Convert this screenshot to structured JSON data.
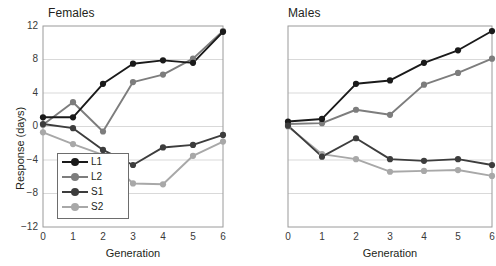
{
  "figure": {
    "ylabel": "Response (days)",
    "xlabel": "Generation"
  },
  "panels": {
    "females": {
      "title": "Females",
      "xlabel": "Generation",
      "ylabel": "Response (days)",
      "xticks": [
        "0",
        "1",
        "2",
        "3",
        "4",
        "5",
        "6"
      ],
      "yticks": [
        "12",
        "8",
        "4",
        "0",
        "−4",
        "−8",
        "−12"
      ]
    },
    "males": {
      "title": "Males",
      "xlabel": "Generation",
      "xticks": [
        "0",
        "1",
        "2",
        "3",
        "4",
        "5",
        "6"
      ]
    }
  },
  "legend": {
    "items": [
      {
        "label": "L1",
        "color": "#1a1a1a"
      },
      {
        "label": "L2",
        "color": "#7d7d7d"
      },
      {
        "label": "S1",
        "color": "#3d3d3d"
      },
      {
        "label": "S2",
        "color": "#a8a8a8"
      }
    ]
  },
  "colors": {
    "L1": "#1a1a1a",
    "L2": "#7d7d7d",
    "S1": "#3d3d3d",
    "S2": "#a8a8a8",
    "grid": "#d9d9d9",
    "axis": "#9a9a9a",
    "text": "#231f20"
  },
  "chart_data": [
    {
      "type": "line",
      "title": "Females",
      "xlabel": "Generation",
      "ylabel": "Response (days)",
      "x": [
        0,
        1,
        2,
        3,
        4,
        5,
        6
      ],
      "xlim": [
        0,
        6
      ],
      "ylim": [
        -12,
        12
      ],
      "yticks": [
        12,
        8,
        4,
        0,
        -4,
        -8,
        -12
      ],
      "grid": true,
      "legend_position": "lower-left",
      "series": [
        {
          "name": "L1",
          "color": "#1a1a1a",
          "values": [
            1.1,
            1.1,
            5.1,
            7.5,
            7.9,
            7.6,
            11.3
          ]
        },
        {
          "name": "L2",
          "color": "#7d7d7d",
          "values": [
            0.2,
            2.9,
            -0.6,
            5.3,
            6.2,
            8.1,
            11.4
          ]
        },
        {
          "name": "S1",
          "color": "#3d3d3d",
          "values": [
            0.3,
            -0.2,
            -2.8,
            -4.6,
            -2.5,
            -2.2,
            -1.0
          ]
        },
        {
          "name": "S2",
          "color": "#a8a8a8",
          "values": [
            -0.7,
            -2.1,
            -3.4,
            -6.8,
            -6.9,
            -3.5,
            -1.8
          ]
        }
      ]
    },
    {
      "type": "line",
      "title": "Males",
      "xlabel": "Generation",
      "ylabel": "Response (days)",
      "x": [
        0,
        1,
        2,
        3,
        4,
        5,
        6
      ],
      "xlim": [
        0,
        6
      ],
      "ylim": [
        -12,
        12
      ],
      "yticks": [
        12,
        8,
        4,
        0,
        -4,
        -8,
        -12
      ],
      "grid": true,
      "legend_position": "none",
      "series": [
        {
          "name": "L1",
          "color": "#1a1a1a",
          "values": [
            0.6,
            0.9,
            5.1,
            5.5,
            7.6,
            9.1,
            11.4
          ]
        },
        {
          "name": "L2",
          "color": "#7d7d7d",
          "values": [
            0.3,
            0.4,
            2.0,
            1.4,
            5.0,
            6.4,
            8.1
          ]
        },
        {
          "name": "S1",
          "color": "#3d3d3d",
          "values": [
            0.1,
            -3.6,
            -1.4,
            -3.9,
            -4.1,
            -3.9,
            -4.6
          ]
        },
        {
          "name": "S2",
          "color": "#a8a8a8",
          "values": [
            0.0,
            -3.3,
            -3.9,
            -5.4,
            -5.3,
            -5.2,
            -5.9
          ]
        }
      ]
    }
  ]
}
